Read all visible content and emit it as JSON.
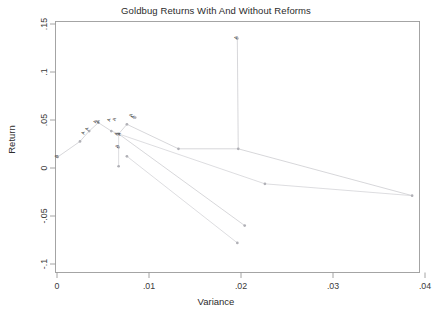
{
  "chart_data": {
    "type": "scatter",
    "title": "Goldbug Returns With And Without Reforms",
    "xlabel": "Variance",
    "ylabel": "Return",
    "xlim": [
      0,
      0.0425
    ],
    "ylim": [
      -0.1,
      0.15
    ],
    "xticks": [
      0,
      0.01,
      0.02,
      0.03,
      0.04
    ],
    "xticklabels": [
      "0",
      ".01",
      ".02",
      ".03",
      ".04"
    ],
    "yticks": [
      -0.1,
      -0.05,
      0,
      0.05,
      0.1,
      0.15
    ],
    "yticklabels": [
      "-.1",
      "-.05",
      "0",
      ".05",
      ".1",
      ".15"
    ],
    "grid": false,
    "legend": "none",
    "series": [
      {
        "name": "frontier-path-1",
        "points": [
          {
            "x": 8e-05,
            "y": 0.0115
          },
          {
            "x": 0.0025,
            "y": 0.0277
          },
          {
            "x": 0.0035,
            "y": 0.0385
          },
          {
            "x": 0.0045,
            "y": 0.0472
          },
          {
            "x": 0.0059,
            "y": 0.0385
          },
          {
            "x": 0.0067,
            "y": 0.0355
          },
          {
            "x": 0.0076,
            "y": 0.0455
          },
          {
            "x": 0.0132,
            "y": 0.02
          },
          {
            "x": 0.0197,
            "y": 0.02
          },
          {
            "x": 0.0386,
            "y": -0.0288
          }
        ]
      },
      {
        "name": "frontier-path-2",
        "points": [
          {
            "x": 0.0067,
            "y": 0.0018
          },
          {
            "x": 0.0067,
            "y": 0.0215
          },
          {
            "x": 0.0067,
            "y": 0.0355
          },
          {
            "x": 0.0226,
            "y": -0.0165
          },
          {
            "x": 0.0386,
            "y": -0.0288
          }
        ]
      },
      {
        "name": "frontier-path-3",
        "points": [
          {
            "x": 0.0067,
            "y": 0.0355
          },
          {
            "x": 0.0204,
            "y": -0.06
          }
        ]
      },
      {
        "name": "frontier-path-4",
        "points": [
          {
            "x": 0.0076,
            "y": 0.0122
          },
          {
            "x": 0.0196,
            "y": -0.078
          }
        ]
      },
      {
        "name": "spike-path",
        "points": [
          {
            "x": 0.0196,
            "y": 0.135
          },
          {
            "x": 0.0197,
            "y": 0.02
          }
        ]
      }
    ],
    "markers": [
      {
        "x": 8e-05,
        "y": 0.0115
      },
      {
        "x": 0.0025,
        "y": 0.0277
      },
      {
        "x": 0.0035,
        "y": 0.0385
      },
      {
        "x": 0.0045,
        "y": 0.0472
      },
      {
        "x": 0.0059,
        "y": 0.0385
      },
      {
        "x": 0.0067,
        "y": 0.0355
      },
      {
        "x": 0.0067,
        "y": 0.0215
      },
      {
        "x": 0.0067,
        "y": 0.0018
      },
      {
        "x": 0.0076,
        "y": 0.0455
      },
      {
        "x": 0.0076,
        "y": 0.0122
      },
      {
        "x": 0.0085,
        "y": 0.0525
      },
      {
        "x": 0.0132,
        "y": 0.02
      },
      {
        "x": 0.0196,
        "y": 0.135
      },
      {
        "x": 0.0197,
        "y": 0.02
      },
      {
        "x": 0.0204,
        "y": -0.06
      },
      {
        "x": 0.0196,
        "y": -0.078
      },
      {
        "x": 0.0226,
        "y": -0.0165
      },
      {
        "x": 0.0386,
        "y": -0.0288
      }
    ],
    "annotations": [
      {
        "x": 8e-05,
        "y": 0.0118,
        "text": "A"
      },
      {
        "x": 0.003,
        "y": 0.0362,
        "text": "A"
      },
      {
        "x": 0.0034,
        "y": 0.0405,
        "text": "A"
      },
      {
        "x": 0.0043,
        "y": 0.0478,
        "text": "A"
      },
      {
        "x": 0.0046,
        "y": 0.048,
        "text": "A"
      },
      {
        "x": 0.0058,
        "y": 0.0498,
        "text": "A"
      },
      {
        "x": 0.0064,
        "y": 0.0502,
        "text": "A"
      },
      {
        "x": 0.0066,
        "y": 0.0352,
        "text": "A"
      },
      {
        "x": 0.0069,
        "y": 0.0348,
        "text": "A"
      },
      {
        "x": 0.0067,
        "y": 0.0222,
        "text": "A"
      },
      {
        "x": 0.0082,
        "y": 0.0545,
        "text": "A"
      },
      {
        "x": 0.0084,
        "y": 0.0528,
        "text": "A"
      },
      {
        "x": 0.0196,
        "y": 0.1355,
        "text": "A"
      }
    ]
  }
}
